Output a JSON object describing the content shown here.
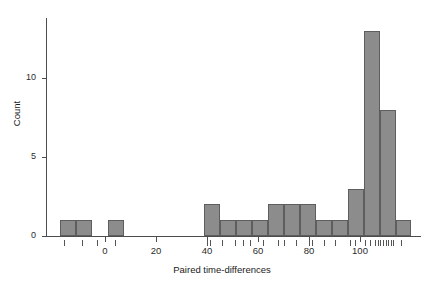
{
  "chart_data": {
    "type": "bar",
    "title": "",
    "xlabel": "Paired time-differences",
    "ylabel": "Count",
    "xlim": [
      -20,
      122
    ],
    "ylim": [
      0,
      13.8
    ],
    "grid": false,
    "legend": null,
    "bin_width": 6.27,
    "bin_edges": [
      -17.6,
      -11.4,
      -5.1,
      1.2,
      7.4,
      13.7,
      20.0,
      26.2,
      32.5,
      38.8,
      45.0,
      51.3,
      57.6,
      63.8,
      70.1,
      76.4,
      82.6,
      88.9,
      95.2,
      101.4,
      107.7,
      114.0,
      120.2
    ],
    "categories": [
      "-17.6",
      "-11.4",
      "-5.1",
      "1.2",
      "7.4",
      "13.7",
      "20.0",
      "26.2",
      "32.5",
      "38.8",
      "45.0",
      "51.3",
      "57.6",
      "63.8",
      "70.1",
      "76.4",
      "82.6",
      "88.9",
      "95.2",
      "101.4",
      "107.7",
      "114.0"
    ],
    "values": [
      1,
      1,
      0,
      1,
      0,
      0,
      0,
      0,
      0,
      2,
      1,
      1,
      1,
      2,
      2,
      2,
      1,
      1,
      3,
      13,
      8,
      1
    ],
    "xticks": [
      0,
      20,
      40,
      60,
      80,
      100
    ],
    "xtick_labels": [
      "0",
      "20",
      "40",
      "60",
      "80",
      "100"
    ],
    "yticks": [
      0,
      5,
      10
    ],
    "ytick_labels": [
      "0",
      "5",
      "10"
    ],
    "bar_color": "#8c8c8c",
    "bar_edge_color": "#5e5e5e",
    "axis_color": "#4d4d4d",
    "rug_values": [
      -16,
      -9,
      -3,
      4,
      40,
      41,
      46,
      51,
      54,
      57,
      62,
      68,
      70,
      75,
      80,
      81,
      86,
      90,
      96,
      98,
      102,
      104,
      106,
      107,
      108,
      109,
      110,
      111,
      112,
      113,
      116
    ]
  }
}
